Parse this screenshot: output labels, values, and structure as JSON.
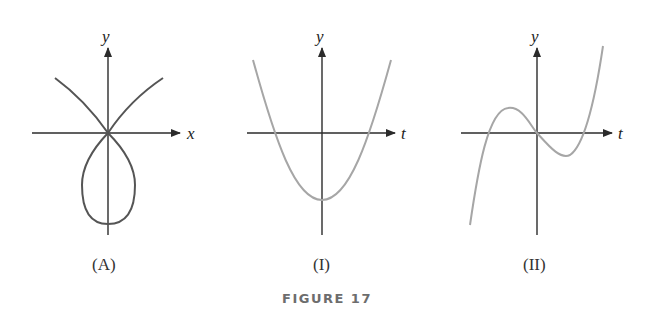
{
  "figure": {
    "caption": "FIGURE 17",
    "colors": {
      "axis": "#2b2b2b",
      "curve_A": "#555555",
      "curves_I_II": "#a6a6a6",
      "caption": "#6d6d6d"
    }
  },
  "panels": [
    {
      "id": "A",
      "label": "(A)",
      "x_axis_label": "x",
      "y_axis_label": "y",
      "curve": "parametric loop curve crossing itself at origin"
    },
    {
      "id": "I",
      "label": "(I)",
      "x_axis_label": "t",
      "y_axis_label": "y",
      "curve": "upward parabola with negative minimum at t=0"
    },
    {
      "id": "II",
      "label": "(II)",
      "x_axis_label": "t",
      "y_axis_label": "y",
      "curve": "cubic through origin with local max left, local min right"
    }
  ]
}
